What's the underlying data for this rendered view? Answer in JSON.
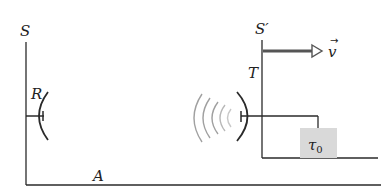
{
  "diagram": {
    "frames": {
      "rest_frame": {
        "label": "S"
      },
      "moving_frame": {
        "label": "S′"
      }
    },
    "receiver": {
      "label": "R"
    },
    "transmitter": {
      "label": "T"
    },
    "velocity": {
      "label": "v",
      "vector_accent": "→"
    },
    "proper_time_box": {
      "symbol": "τ",
      "subscript": "0",
      "fill": "#d9d9d9"
    },
    "ground_label": "A",
    "colors": {
      "line": "#2a2a2a",
      "arrow": "#555555",
      "waves": "#a0a0a0"
    }
  }
}
